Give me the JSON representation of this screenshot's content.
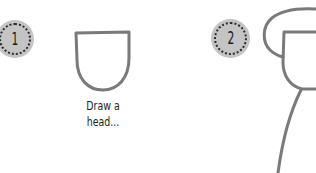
{
  "steps": [
    {
      "number": "1",
      "caption_line1": "Draw a",
      "caption_line2": "head..."
    },
    {
      "number": "2"
    }
  ],
  "colors": {
    "stroke": "#7a7a7a",
    "badge_fill": "#c4c4c4",
    "badge_dots": "#2a2a2a",
    "text": "#1e1e1e",
    "background": "#ffffff"
  }
}
